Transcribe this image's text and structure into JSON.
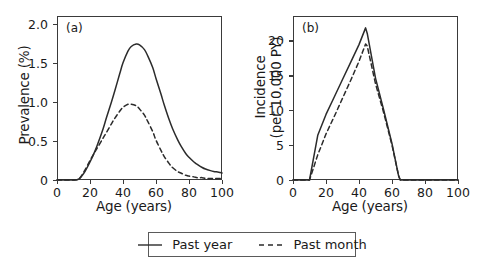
{
  "figure": {
    "width": 481,
    "height": 267,
    "background": "#ffffff",
    "line_color": "#2b2b2b"
  },
  "legend": {
    "entries": [
      {
        "label": "Past year",
        "style": "solid",
        "swatch": "solid-line-icon"
      },
      {
        "label": "Past month",
        "style": "dashed",
        "swatch": "dashed-line-icon"
      }
    ]
  },
  "chart_data": [
    {
      "type": "line",
      "panel_tag": "(a)",
      "title": "",
      "xlabel": "Age (years)",
      "ylabel": "Prevalence (%)",
      "xlim": [
        0,
        100
      ],
      "ylim": [
        0,
        2.1
      ],
      "xticks": [
        0,
        20,
        40,
        60,
        80,
        100
      ],
      "xticklabels": [
        "0",
        "20",
        "40",
        "60",
        "80",
        "100"
      ],
      "yticks": [
        0,
        0.5,
        1.0,
        1.5,
        2.0
      ],
      "yticklabels": [
        "0",
        "0.5",
        "1.0",
        "1.5",
        "2.0"
      ],
      "grid": false,
      "legend_position": "below-figure",
      "x": [
        0,
        5,
        10,
        13,
        15,
        17,
        20,
        23,
        25,
        28,
        30,
        33,
        35,
        38,
        40,
        43,
        45,
        48,
        50,
        53,
        55,
        58,
        60,
        63,
        65,
        68,
        70,
        73,
        75,
        78,
        80,
        83,
        85,
        88,
        90,
        93,
        95,
        98,
        100
      ],
      "series": [
        {
          "name": "Past year",
          "style": "solid",
          "values": [
            0.0,
            0.0,
            0.0,
            0.01,
            0.05,
            0.11,
            0.23,
            0.37,
            0.48,
            0.66,
            0.8,
            1.0,
            1.14,
            1.36,
            1.5,
            1.65,
            1.71,
            1.74,
            1.73,
            1.67,
            1.59,
            1.44,
            1.3,
            1.1,
            0.96,
            0.77,
            0.66,
            0.52,
            0.44,
            0.34,
            0.29,
            0.23,
            0.2,
            0.16,
            0.14,
            0.12,
            0.11,
            0.1,
            0.09
          ]
        },
        {
          "name": "Past month",
          "style": "dashed",
          "values": [
            0.0,
            0.0,
            0.0,
            0.01,
            0.06,
            0.13,
            0.25,
            0.36,
            0.43,
            0.54,
            0.61,
            0.72,
            0.79,
            0.88,
            0.93,
            0.97,
            0.97,
            0.95,
            0.91,
            0.83,
            0.75,
            0.62,
            0.51,
            0.38,
            0.3,
            0.21,
            0.16,
            0.11,
            0.09,
            0.06,
            0.05,
            0.04,
            0.03,
            0.03,
            0.02,
            0.02,
            0.02,
            0.02,
            0.02
          ]
        }
      ]
    },
    {
      "type": "line",
      "panel_tag": "(b)",
      "title": "",
      "xlabel": "Age (years)",
      "ylabel": "Incidence (per 10,000 PY)",
      "xlim": [
        0,
        100
      ],
      "ylim": [
        0,
        23.5
      ],
      "xticks": [
        0,
        20,
        40,
        60,
        80,
        100
      ],
      "xticklabels": [
        "0",
        "20",
        "40",
        "60",
        "80",
        "100"
      ],
      "yticks": [
        0,
        5,
        10,
        15,
        20
      ],
      "yticklabels": [
        "0",
        "5",
        "10",
        "15",
        "20"
      ],
      "grid": false,
      "legend_position": "below-figure",
      "x": [
        0,
        5,
        10,
        15,
        20,
        25,
        30,
        35,
        40,
        44,
        45,
        50,
        55,
        60,
        64,
        65,
        70,
        80,
        90,
        100
      ],
      "series": [
        {
          "name": "Past year",
          "style": "solid",
          "values": [
            0.0,
            0.0,
            0.0,
            6.4,
            9.4,
            11.9,
            14.4,
            16.9,
            19.4,
            21.8,
            21.0,
            14.6,
            10.0,
            5.2,
            0.6,
            0.0,
            0.0,
            0.0,
            0.0,
            0.0
          ]
        },
        {
          "name": "Past month",
          "style": "dashed",
          "values": [
            0.0,
            0.0,
            0.0,
            3.6,
            6.6,
            9.1,
            11.7,
            14.3,
            17.0,
            19.5,
            19.2,
            13.8,
            9.6,
            5.0,
            0.6,
            0.0,
            0.0,
            0.0,
            0.0,
            0.0
          ]
        }
      ]
    }
  ]
}
